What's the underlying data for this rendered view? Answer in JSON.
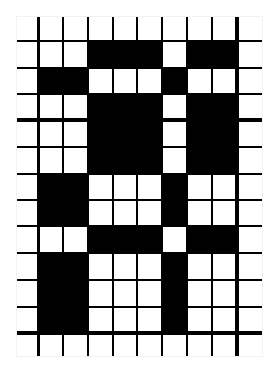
{
  "puzzle": {
    "type": "grid-pattern",
    "cols": 10,
    "rows": 13,
    "origin": [
      17,
      17
    ],
    "col_edges": [
      0,
      21,
      46,
      71,
      96,
      120,
      145,
      170,
      195,
      220,
      245
    ],
    "row_edges": [
      0,
      24,
      51,
      77,
      103,
      130,
      157,
      183,
      209,
      236,
      263,
      290,
      316,
      339
    ],
    "colors": {
      "fill": "#000000",
      "empty": "#ffffff",
      "line": "#000000"
    },
    "cells": [
      [
        0,
        0,
        0,
        0,
        0,
        0,
        0,
        0,
        0,
        0
      ],
      [
        0,
        0,
        0,
        1,
        1,
        1,
        0,
        1,
        1,
        0
      ],
      [
        0,
        1,
        1,
        0,
        0,
        0,
        1,
        0,
        0,
        0
      ],
      [
        0,
        0,
        0,
        1,
        1,
        1,
        0,
        1,
        1,
        0
      ],
      [
        0,
        0,
        0,
        1,
        1,
        1,
        0,
        1,
        1,
        0
      ],
      [
        0,
        0,
        0,
        1,
        1,
        1,
        0,
        1,
        1,
        0
      ],
      [
        0,
        1,
        1,
        0,
        0,
        0,
        1,
        0,
        0,
        0
      ],
      [
        0,
        1,
        1,
        0,
        0,
        0,
        1,
        0,
        0,
        0
      ],
      [
        0,
        0,
        0,
        1,
        1,
        1,
        0,
        1,
        1,
        0
      ],
      [
        0,
        1,
        1,
        0,
        0,
        0,
        1,
        0,
        0,
        0
      ],
      [
        0,
        1,
        1,
        0,
        0,
        0,
        1,
        0,
        0,
        0
      ],
      [
        0,
        1,
        1,
        0,
        0,
        0,
        1,
        0,
        0,
        0
      ],
      [
        0,
        0,
        0,
        0,
        0,
        0,
        0,
        0,
        0,
        0
      ]
    ],
    "vlines": [
      {
        "x": 21,
        "w": 3
      },
      {
        "x": 46,
        "w": 2
      },
      {
        "x": 71,
        "w": 2
      },
      {
        "x": 96,
        "w": 2
      },
      {
        "x": 120,
        "w": 2
      },
      {
        "x": 145,
        "w": 2
      },
      {
        "x": 170,
        "w": 2
      },
      {
        "x": 195,
        "w": 2
      },
      {
        "x": 220,
        "w": 4
      }
    ],
    "hlines": [
      {
        "y": 24,
        "h": 2
      },
      {
        "y": 51,
        "h": 2
      },
      {
        "y": 77,
        "h": 2
      },
      {
        "y": 103,
        "h": 4
      },
      {
        "y": 130,
        "h": 2
      },
      {
        "y": 157,
        "h": 2
      },
      {
        "y": 183,
        "h": 2
      },
      {
        "y": 209,
        "h": 2
      },
      {
        "y": 236,
        "h": 2
      },
      {
        "y": 263,
        "h": 2
      },
      {
        "y": 290,
        "h": 2
      },
      {
        "y": 316,
        "h": 4
      }
    ]
  }
}
